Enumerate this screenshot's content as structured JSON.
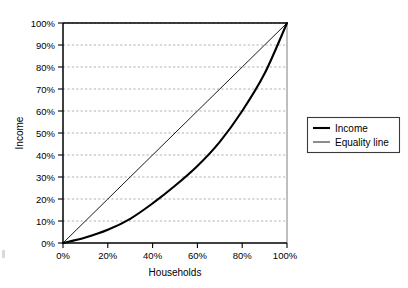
{
  "chart_data": {
    "type": "line",
    "title": "",
    "xlabel": "Households",
    "ylabel": "Income",
    "xlim": [
      0,
      100
    ],
    "ylim": [
      0,
      100
    ],
    "grid": true,
    "grid_axis": "y",
    "legend_position": "right",
    "x_tick_labels": [
      "0%",
      "20%",
      "40%",
      "60%",
      "80%",
      "100%"
    ],
    "x_ticks": [
      0,
      20,
      40,
      60,
      80,
      100
    ],
    "y_tick_labels": [
      "0%",
      "10%",
      "20%",
      "30%",
      "40%",
      "50%",
      "60%",
      "70%",
      "80%",
      "90%",
      "100%"
    ],
    "y_ticks": [
      0,
      10,
      20,
      30,
      40,
      50,
      60,
      70,
      80,
      90,
      100
    ],
    "x": [
      0,
      10,
      20,
      30,
      40,
      50,
      60,
      70,
      80,
      90,
      100
    ],
    "series": [
      {
        "name": "Income",
        "style": "thick",
        "color": "#000000",
        "values": [
          0,
          2.5,
          6,
          11,
          18,
          26,
          35,
          46,
          60,
          77,
          100
        ]
      },
      {
        "name": "Equality line",
        "style": "thin",
        "color": "#000000",
        "values": [
          0,
          10,
          20,
          30,
          40,
          50,
          60,
          70,
          80,
          90,
          100
        ]
      }
    ],
    "legend_entries": [
      "Income",
      "Equality line"
    ]
  },
  "axis": {
    "y_title": "Income",
    "x_title": "Households",
    "y_labels": {
      "t0": "0%",
      "t1": "10%",
      "t2": "20%",
      "t3": "30%",
      "t4": "40%",
      "t5": "50%",
      "t6": "60%",
      "t7": "70%",
      "t8": "80%",
      "t9": "90%",
      "t10": "100%"
    },
    "x_labels": {
      "t0": "0%",
      "t1": "20%",
      "t2": "40%",
      "t3": "60%",
      "t4": "80%",
      "t5": "100%"
    }
  },
  "legend": {
    "items": [
      {
        "label": "Income"
      },
      {
        "label": "Equality line"
      }
    ]
  },
  "colors": {
    "series_line": "#000000",
    "gridline": "#8f8f8f",
    "axis": "#000000",
    "legend_border": "#3a3a3a",
    "background": "#ffffff"
  }
}
